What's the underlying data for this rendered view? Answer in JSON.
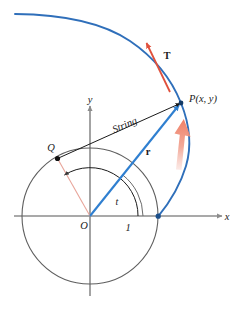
{
  "figure": {
    "canvas": {
      "width": 241,
      "height": 310
    },
    "colors": {
      "curve_blue": "#2f6fba",
      "vector_blue": "#2f7fd0",
      "axis_gray": "#8c8c8c",
      "circle_gray": "#6b6b6b",
      "string_black": "#1a1a1a",
      "tangent_red": "#e0503c",
      "motion_arrow": "#f08a78",
      "radius_pink": "#e8a59a",
      "label_black": "#1a1a1a"
    },
    "geometry": {
      "origin": {
        "x": 90,
        "y": 216
      },
      "circle_radius": 68,
      "point_P": {
        "x": 181,
        "y": 103
      },
      "point_Q": {
        "x": 57,
        "y": 158
      },
      "curve_start": {
        "x": 158,
        "y": 216
      },
      "x_axis_label_tick": 1
    }
  },
  "labels": {
    "x_axis": "x",
    "y_axis": "y",
    "origin": "O",
    "unit_tick": "1",
    "angle": "t",
    "point_p": "P(x, y)",
    "point_q": "Q",
    "string": "String",
    "tangent_vector": "T",
    "radius_vector": "r"
  }
}
